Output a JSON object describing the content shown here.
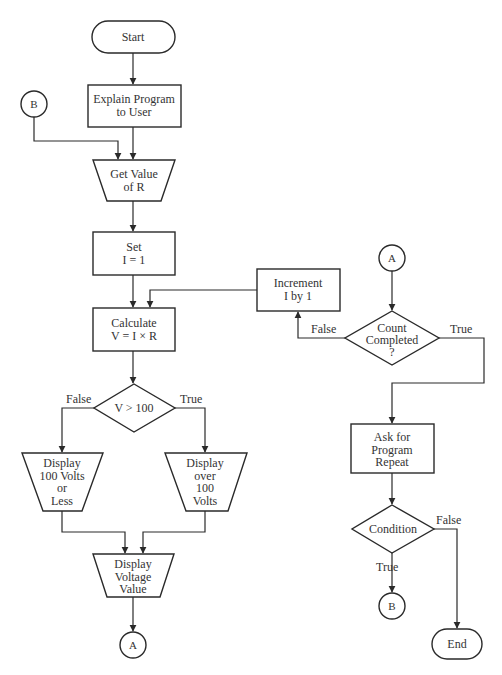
{
  "diagram": {
    "type": "flowchart",
    "colors": {
      "stroke": "#2a2a2a",
      "text": "#333333",
      "background": "#ffffff"
    },
    "nodes": {
      "start": {
        "shape": "terminator",
        "lines": [
          "Start"
        ]
      },
      "explain": {
        "shape": "process",
        "lines": [
          "Explain Program",
          "to User"
        ]
      },
      "get_value": {
        "shape": "manual-input",
        "lines": [
          "Get Value",
          "of R"
        ]
      },
      "set_i": {
        "shape": "process",
        "lines": [
          "Set",
          "I = 1"
        ]
      },
      "calculate": {
        "shape": "process",
        "lines": [
          "Calculate",
          "V = I × R"
        ]
      },
      "v_check": {
        "shape": "decision",
        "lines": [
          "V > 100"
        ]
      },
      "display_low": {
        "shape": "display",
        "lines": [
          "Display",
          "100 Volts",
          "or",
          "Less"
        ]
      },
      "display_high": {
        "shape": "display",
        "lines": [
          "Display",
          "over",
          "100",
          "Volts"
        ]
      },
      "display_voltage": {
        "shape": "display",
        "lines": [
          "Display",
          "Voltage",
          "Value"
        ]
      },
      "connector_a_out": {
        "shape": "connector",
        "lines": [
          "A"
        ]
      },
      "connector_b_in": {
        "shape": "connector",
        "lines": [
          "B"
        ]
      },
      "connector_a_in": {
        "shape": "connector",
        "lines": [
          "A"
        ]
      },
      "count_check": {
        "shape": "decision",
        "lines": [
          "Count",
          "Completed",
          "?"
        ]
      },
      "increment": {
        "shape": "process",
        "lines": [
          "Increment",
          "I by 1"
        ]
      },
      "ask_repeat": {
        "shape": "process",
        "lines": [
          "Ask for",
          "Program",
          "Repeat"
        ]
      },
      "condition": {
        "shape": "decision",
        "lines": [
          "Condition"
        ]
      },
      "connector_b_out": {
        "shape": "connector",
        "lines": [
          "B"
        ]
      },
      "end": {
        "shape": "terminator",
        "lines": [
          "End"
        ]
      }
    },
    "edge_labels": {
      "v_false": "False",
      "v_true": "True",
      "count_false": "False",
      "count_true": "True",
      "cond_true": "True",
      "cond_false": "False"
    },
    "edges": [
      {
        "from": "start",
        "to": "explain"
      },
      {
        "from": "explain",
        "to": "get_value"
      },
      {
        "from": "connector_b_in",
        "to": "get_value"
      },
      {
        "from": "get_value",
        "to": "set_i"
      },
      {
        "from": "set_i",
        "to": "calculate"
      },
      {
        "from": "increment",
        "to": "calculate"
      },
      {
        "from": "calculate",
        "to": "v_check"
      },
      {
        "from": "v_check",
        "to": "display_low",
        "label": "False"
      },
      {
        "from": "v_check",
        "to": "display_high",
        "label": "True"
      },
      {
        "from": "display_low",
        "to": "display_voltage"
      },
      {
        "from": "display_high",
        "to": "display_voltage"
      },
      {
        "from": "display_voltage",
        "to": "connector_a_out"
      },
      {
        "from": "connector_a_in",
        "to": "count_check"
      },
      {
        "from": "count_check",
        "to": "increment",
        "label": "False"
      },
      {
        "from": "count_check",
        "to": "ask_repeat",
        "label": "True"
      },
      {
        "from": "ask_repeat",
        "to": "condition"
      },
      {
        "from": "condition",
        "to": "connector_b_out",
        "label": "True"
      },
      {
        "from": "condition",
        "to": "end",
        "label": "False"
      }
    ]
  },
  "caption": ""
}
